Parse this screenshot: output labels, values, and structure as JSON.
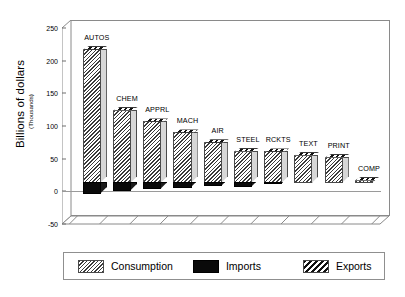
{
  "chart_data": {
    "type": "bar",
    "title": "",
    "subtitle": "",
    "xlabel": "",
    "ylabel": "Billions of dollars",
    "ylabel_sub": "(Thousands)",
    "ylim": [
      -50,
      250
    ],
    "yticks": [
      250,
      200,
      150,
      100,
      50,
      0,
      -50
    ],
    "ytick_labels": [
      "250",
      "200",
      "150",
      "100",
      "50",
      "0",
      "-50"
    ],
    "grid": false,
    "legend_position": "bottom",
    "style": "3d-column",
    "categories": [
      "AUTOS",
      "CHEM",
      "APPRL",
      "MACH",
      "AIR",
      "STEEL",
      "RCKTS",
      "TEXT",
      "PRINT",
      "COMP"
    ],
    "series": [
      {
        "name": "Consumption",
        "color": "#c9c9c9",
        "pattern": "diagonal-hatch",
        "values": [
          208,
          115,
          97,
          80,
          65,
          52,
          51,
          46,
          43,
          8
        ]
      },
      {
        "name": "Imports",
        "color": "#0a0a0a",
        "pattern": "solid",
        "values": [
          -18,
          -13,
          -10,
          -8,
          -6,
          -7,
          -2,
          -1,
          -1,
          0
        ]
      },
      {
        "name": "Exports",
        "color": "#ffffff",
        "pattern": "bold-diagonal-hatch",
        "values": [
          8,
          7,
          5,
          6,
          6,
          4,
          4,
          3,
          3,
          3
        ]
      }
    ]
  },
  "legend": {
    "items": [
      {
        "label": "Consumption",
        "swatch": "consumption"
      },
      {
        "label": "Imports",
        "swatch": "imports"
      },
      {
        "label": "Exports",
        "swatch": "exports"
      }
    ]
  }
}
